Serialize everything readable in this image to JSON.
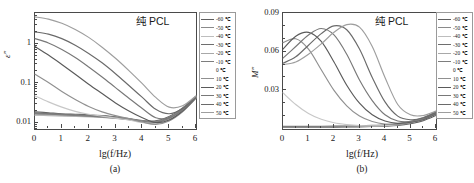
{
  "figure": {
    "annotation": "纯 PCL",
    "xlabel": "lg(f/Hz)",
    "panel_a_label": "(a)",
    "panel_b_label": "(b)",
    "ylabel_a": "ε″",
    "ylabel_b": "M″"
  },
  "legend": {
    "entries": [
      {
        "label": "-60 ℃",
        "color": "#5f5f5f"
      },
      {
        "label": "-50 ℃",
        "color": "#8a8a8a"
      },
      {
        "label": "-40 ℃",
        "color": "#bdbdbd"
      },
      {
        "label": "-30 ℃",
        "color": "#6e6e6e"
      },
      {
        "label": "-20 ℃",
        "color": "#a8a8a8"
      },
      {
        "label": "-10 ℃",
        "color": "#7d7d7d"
      },
      {
        "label": "0 ℃",
        "color": "#c8c8c8"
      },
      {
        "label": "10 ℃",
        "color": "#909090"
      },
      {
        "label": "20 ℃",
        "color": "#5a5a5a"
      },
      {
        "label": "30 ℃",
        "color": "#787878"
      },
      {
        "label": "40 ℃",
        "color": "#6a6a6a"
      },
      {
        "label": "50 ℃",
        "color": "#9e9e9e"
      }
    ]
  },
  "chart_data": [
    {
      "type": "line",
      "panel": "(a)",
      "title": "纯 PCL",
      "xlabel": "lg(f/Hz)",
      "ylabel": "ε″",
      "xlim": [
        0,
        6
      ],
      "ylim": [
        0.007,
        6
      ],
      "yscale": "log",
      "xticks": [
        0,
        1,
        2,
        3,
        4,
        5,
        6
      ],
      "yticks": [
        0.01,
        0.1,
        1
      ],
      "grid": false,
      "legend_position": "right-outside",
      "x": [
        0,
        0.5,
        1,
        1.5,
        2,
        2.5,
        3,
        3.5,
        4,
        4.5,
        5,
        5.5,
        6
      ],
      "series": [
        {
          "name": "-60 ℃",
          "color": "#5f5f5f",
          "values": [
            0.019,
            0.018,
            0.017,
            0.0165,
            0.016,
            0.0152,
            0.0142,
            0.0128,
            0.0115,
            0.0112,
            0.0145,
            0.024,
            0.047
          ]
        },
        {
          "name": "-50 ℃",
          "color": "#8a8a8a",
          "values": [
            0.018,
            0.0172,
            0.0165,
            0.016,
            0.0155,
            0.0148,
            0.0138,
            0.0125,
            0.0112,
            0.0108,
            0.0138,
            0.023,
            0.046
          ]
        },
        {
          "name": "-40 ℃",
          "color": "#bdbdbd",
          "values": [
            0.0155,
            0.0152,
            0.0148,
            0.0145,
            0.0142,
            0.0138,
            0.013,
            0.012,
            0.0108,
            0.0102,
            0.0125,
            0.021,
            0.044
          ]
        },
        {
          "name": "-30 ℃",
          "color": "#6e6e6e",
          "values": [
            0.0178,
            0.017,
            0.0162,
            0.0156,
            0.015,
            0.0143,
            0.0134,
            0.0122,
            0.011,
            0.0105,
            0.0132,
            0.022,
            0.045
          ]
        },
        {
          "name": "-20 ℃",
          "color": "#a8a8a8",
          "values": [
            0.0165,
            0.016,
            0.0155,
            0.015,
            0.0146,
            0.014,
            0.0132,
            0.0121,
            0.0109,
            0.0103,
            0.0128,
            0.0215,
            0.0445
          ]
        },
        {
          "name": "-10 ℃",
          "color": "#7d7d7d",
          "values": [
            0.0172,
            0.0166,
            0.016,
            0.0154,
            0.0148,
            0.0141,
            0.0133,
            0.0122,
            0.011,
            0.0104,
            0.013,
            0.0218,
            0.0448
          ]
        },
        {
          "name": "0 ℃",
          "color": "#c8c8c8",
          "values": [
            0.048,
            0.034,
            0.025,
            0.0195,
            0.0165,
            0.0148,
            0.0132,
            0.0118,
            0.0102,
            0.0096,
            0.0118,
            0.02,
            0.043
          ]
        },
        {
          "name": "10 ℃",
          "color": "#909090",
          "values": [
            0.17,
            0.105,
            0.062,
            0.039,
            0.026,
            0.019,
            0.0152,
            0.0128,
            0.0105,
            0.0092,
            0.0112,
            0.019,
            0.042
          ]
        },
        {
          "name": "20 ℃",
          "color": "#5a5a5a",
          "values": [
            0.85,
            0.52,
            0.3,
            0.17,
            0.095,
            0.055,
            0.032,
            0.02,
            0.0135,
            0.0102,
            0.0118,
            0.02,
            0.043
          ]
        },
        {
          "name": "30 ℃",
          "color": "#787878",
          "values": [
            1.35,
            1.05,
            0.72,
            0.45,
            0.26,
            0.145,
            0.078,
            0.042,
            0.023,
            0.0135,
            0.0135,
            0.021,
            0.044
          ]
        },
        {
          "name": "40 ℃",
          "color": "#6a6a6a",
          "values": [
            2.0,
            1.75,
            1.35,
            0.92,
            0.57,
            0.33,
            0.175,
            0.088,
            0.044,
            0.022,
            0.017,
            0.023,
            0.046
          ]
        },
        {
          "name": "50 ℃",
          "color": "#9e9e9e",
          "values": [
            4.8,
            4.2,
            3.3,
            2.3,
            1.45,
            0.82,
            0.43,
            0.21,
            0.098,
            0.044,
            0.025,
            0.027,
            0.048
          ]
        }
      ]
    },
    {
      "type": "line",
      "panel": "(b)",
      "title": "纯 PCL",
      "xlabel": "lg(f/Hz)",
      "ylabel": "M″",
      "xlim": [
        0,
        6
      ],
      "ylim": [
        0,
        0.09
      ],
      "yscale": "linear",
      "xticks": [
        0,
        1,
        2,
        3,
        4,
        5,
        6
      ],
      "yticks": [
        0.03,
        0.06,
        0.09
      ],
      "grid": false,
      "legend_position": "right-outside",
      "x": [
        0,
        0.5,
        1,
        1.5,
        2,
        2.5,
        3,
        3.5,
        4,
        4.5,
        5,
        5.5,
        6
      ],
      "series": [
        {
          "name": "-60 ℃",
          "color": "#5f5f5f",
          "values": [
            0.0015,
            0.0015,
            0.0015,
            0.0015,
            0.0015,
            0.0016,
            0.0017,
            0.0019,
            0.0022,
            0.0028,
            0.0042,
            0.0065,
            0.0105
          ]
        },
        {
          "name": "-50 ℃",
          "color": "#8a8a8a",
          "values": [
            0.0016,
            0.0016,
            0.0016,
            0.0016,
            0.0017,
            0.0018,
            0.0019,
            0.0021,
            0.0025,
            0.0032,
            0.0048,
            0.0072,
            0.0115
          ]
        },
        {
          "name": "-40 ℃",
          "color": "#bdbdbd",
          "values": [
            0.0018,
            0.0018,
            0.0018,
            0.0018,
            0.0019,
            0.002,
            0.0021,
            0.0024,
            0.0028,
            0.0036,
            0.0052,
            0.0078,
            0.0122
          ]
        },
        {
          "name": "-30 ℃",
          "color": "#6e6e6e",
          "values": [
            0.0017,
            0.0017,
            0.0017,
            0.0017,
            0.0018,
            0.0019,
            0.002,
            0.0022,
            0.0026,
            0.0034,
            0.005,
            0.0075,
            0.0118
          ]
        },
        {
          "name": "-20 ℃",
          "color": "#a8a8a8",
          "values": [
            0.0019,
            0.0019,
            0.0019,
            0.0019,
            0.002,
            0.0021,
            0.0022,
            0.0025,
            0.0029,
            0.0038,
            0.0055,
            0.0082,
            0.0128
          ]
        },
        {
          "name": "-10 ℃",
          "color": "#7d7d7d",
          "values": [
            0.002,
            0.002,
            0.002,
            0.0021,
            0.0022,
            0.0023,
            0.0025,
            0.0028,
            0.0033,
            0.0042,
            0.006,
            0.0088,
            0.0135
          ]
        },
        {
          "name": "0 ℃",
          "color": "#c8c8c8",
          "values": [
            0.028,
            0.019,
            0.012,
            0.0075,
            0.0048,
            0.0034,
            0.0026,
            0.0024,
            0.0026,
            0.0034,
            0.005,
            0.0076,
            0.012
          ]
        },
        {
          "name": "10 ℃",
          "color": "#909090",
          "values": [
            0.067,
            0.07,
            0.062,
            0.046,
            0.03,
            0.018,
            0.01,
            0.0058,
            0.0038,
            0.0036,
            0.0048,
            0.0072,
            0.0115
          ]
        },
        {
          "name": "20 ℃",
          "color": "#5a5a5a",
          "values": [
            0.062,
            0.072,
            0.075,
            0.068,
            0.052,
            0.034,
            0.02,
            0.011,
            0.0062,
            0.0044,
            0.0052,
            0.0074,
            0.0118
          ]
        },
        {
          "name": "30 ℃",
          "color": "#787878",
          "values": [
            0.055,
            0.064,
            0.073,
            0.078,
            0.073,
            0.058,
            0.038,
            0.022,
            0.011,
            0.0062,
            0.0058,
            0.0078,
            0.0122
          ]
        },
        {
          "name": "40 ℃",
          "color": "#6a6a6a",
          "values": [
            0.051,
            0.056,
            0.065,
            0.074,
            0.08,
            0.077,
            0.062,
            0.04,
            0.021,
            0.01,
            0.0072,
            0.0085,
            0.0128
          ]
        },
        {
          "name": "50 ℃",
          "color": "#9e9e9e",
          "values": [
            0.05,
            0.052,
            0.058,
            0.066,
            0.075,
            0.081,
            0.079,
            0.064,
            0.04,
            0.019,
            0.011,
            0.0105,
            0.014
          ]
        }
      ]
    }
  ]
}
